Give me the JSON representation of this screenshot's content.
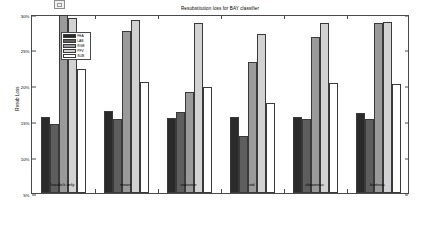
{
  "window": {
    "artifact_icon": "window-thumbnail-icon"
  },
  "chart_data": {
    "type": "bar",
    "title": "Resubstitution loss for BAY classifier",
    "xlabel": "",
    "ylabel": "Resub Loss",
    "categories": [
      "haralick only",
      "mean",
      "variance",
      "std",
      "skewness",
      "kurtosis"
    ],
    "ylim": [
      5,
      30
    ],
    "yticks": [
      5,
      10,
      15,
      20,
      25,
      30
    ],
    "ytick_labels": [
      "5%",
      "10%",
      "15%",
      "20%",
      "25%",
      "30%"
    ],
    "grid": false,
    "legend_position": "upper left",
    "series": [
      {
        "name": "FEA",
        "color": "#2b2b2b",
        "values": [
          15.6,
          16.4,
          15.4,
          15.5,
          15.6,
          16.1
        ]
      },
      {
        "name": "LAB",
        "color": "#5e5e5e",
        "values": [
          14.6,
          15.2,
          16.3,
          12.9,
          15.3,
          15.3
        ]
      },
      {
        "name": "RGB",
        "color": "#9a9a9a",
        "values": [
          29.8,
          27.6,
          19.1,
          23.2,
          26.7,
          28.7
        ]
      },
      {
        "name": "PFV",
        "color": "#d2d2d2",
        "values": [
          29.4,
          29.1,
          28.7,
          27.2,
          28.7,
          28.8
        ]
      },
      {
        "name": "SUB",
        "color": "#ffffff",
        "values": [
          22.3,
          20.4,
          19.8,
          17.5,
          20.3,
          20.1
        ]
      }
    ]
  }
}
